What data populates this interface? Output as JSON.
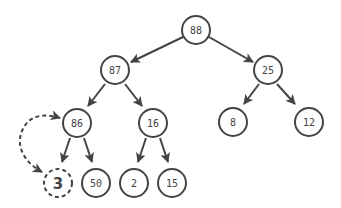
{
  "diagram": {
    "type": "binary-heap-tree",
    "colors": {
      "stroke": "#444444",
      "text": "#444444",
      "background": "#ffffff"
    },
    "nodes": [
      {
        "id": "n88",
        "label": "88",
        "x": 196,
        "y": 30
      },
      {
        "id": "n87",
        "label": "87",
        "x": 115,
        "y": 70
      },
      {
        "id": "n25",
        "label": "25",
        "x": 268,
        "y": 70
      },
      {
        "id": "n86",
        "label": "86",
        "x": 77,
        "y": 123
      },
      {
        "id": "n16",
        "label": "16",
        "x": 153,
        "y": 123
      },
      {
        "id": "n8",
        "label": "8",
        "x": 233,
        "y": 122
      },
      {
        "id": "n12",
        "label": "12",
        "x": 309,
        "y": 122
      },
      {
        "id": "n3",
        "label": "3",
        "x": 58,
        "y": 183,
        "style": "dashed-bold"
      },
      {
        "id": "n50",
        "label": "50",
        "x": 96,
        "y": 183
      },
      {
        "id": "n2",
        "label": "2",
        "x": 134,
        "y": 183
      },
      {
        "id": "n15",
        "label": "15",
        "x": 172,
        "y": 183
      }
    ],
    "edges": [
      {
        "from": "88",
        "to": "87"
      },
      {
        "from": "88",
        "to": "25"
      },
      {
        "from": "87",
        "to": "86"
      },
      {
        "from": "87",
        "to": "16"
      },
      {
        "from": "25",
        "to": "8"
      },
      {
        "from": "25",
        "to": "12"
      },
      {
        "from": "86",
        "to": "3"
      },
      {
        "from": "86",
        "to": "50"
      },
      {
        "from": "16",
        "to": "2"
      },
      {
        "from": "16",
        "to": "15"
      }
    ],
    "swap_arrow": {
      "between": [
        "3",
        "86"
      ],
      "style": "dashed-double-headed"
    }
  }
}
